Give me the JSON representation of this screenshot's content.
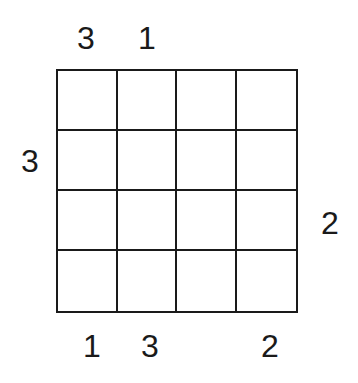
{
  "puzzle": {
    "type": "skyscraper",
    "size": 4,
    "clues": {
      "top": [
        "3",
        "1",
        "",
        ""
      ],
      "bottom": [
        "1",
        "3",
        "",
        "2"
      ],
      "left": [
        "",
        "3",
        "",
        ""
      ],
      "right": [
        "",
        "",
        "2",
        ""
      ]
    },
    "cells": [
      [
        "",
        "",
        "",
        ""
      ],
      [
        "",
        "",
        "",
        ""
      ],
      [
        "",
        "",
        "",
        ""
      ],
      [
        "",
        "",
        "",
        ""
      ]
    ]
  }
}
